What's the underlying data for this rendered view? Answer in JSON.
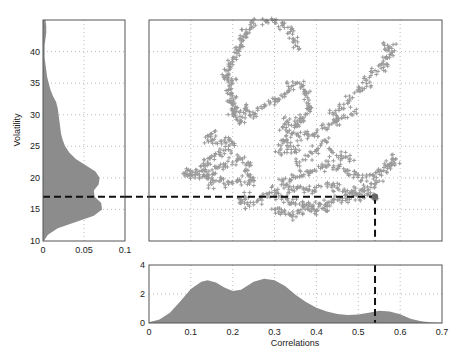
{
  "caption": "",
  "chart_data": [
    {
      "id": "scatter",
      "type": "scatter",
      "title": "",
      "xlabel": "Correlations",
      "ylabel": "Volatility",
      "xlim": [
        0,
        0.7
      ],
      "ylim": [
        10,
        45
      ],
      "xticks": [
        0,
        0.1,
        0.2,
        0.3,
        0.4,
        0.5,
        0.6,
        0.7
      ],
      "yticks": [
        10,
        15,
        20,
        25,
        30,
        35,
        40
      ],
      "grid": true,
      "marker": "+",
      "marker_color": "#9a9a9a",
      "highlight_point": {
        "x": 0.54,
        "y": 17.0,
        "color": "#666666"
      },
      "guide_lines": {
        "style": "dashed",
        "color": "#111111",
        "horizontal_y": 17.0,
        "vertical_x": 0.54
      },
      "series": [
        {
          "name": "trajectory",
          "points": [
            [
              0.28,
              44.8
            ],
            [
              0.3,
              44.6
            ],
            [
              0.32,
              44.2
            ],
            [
              0.34,
              43.5
            ],
            [
              0.345,
              42.0
            ],
            [
              0.35,
              41.0
            ],
            [
              0.25,
              44.5
            ],
            [
              0.24,
              43.5
            ],
            [
              0.23,
              42.8
            ],
            [
              0.225,
              41.8
            ],
            [
              0.22,
              41.0
            ],
            [
              0.215,
              40.0
            ],
            [
              0.2,
              39.0
            ],
            [
              0.19,
              38.0
            ],
            [
              0.19,
              37.0
            ],
            [
              0.185,
              36.2
            ],
            [
              0.19,
              35.5
            ],
            [
              0.2,
              35.0
            ],
            [
              0.19,
              34.0
            ],
            [
              0.2,
              33.0
            ],
            [
              0.195,
              32.0
            ],
            [
              0.2,
              31.5
            ],
            [
              0.21,
              30.5
            ],
            [
              0.2,
              30.0
            ],
            [
              0.21,
              29.5
            ],
            [
              0.23,
              31.0
            ],
            [
              0.24,
              30.5
            ],
            [
              0.22,
              29.0
            ],
            [
              0.25,
              30.0
            ],
            [
              0.27,
              31.0
            ],
            [
              0.29,
              32.0
            ],
            [
              0.31,
              32.5
            ],
            [
              0.33,
              33.5
            ],
            [
              0.34,
              34.5
            ],
            [
              0.36,
              35.0
            ],
            [
              0.37,
              34.0
            ],
            [
              0.375,
              33.0
            ],
            [
              0.38,
              31.5
            ],
            [
              0.385,
              30.5
            ],
            [
              0.37,
              29.5
            ],
            [
              0.36,
              29.0
            ],
            [
              0.35,
              28.5
            ],
            [
              0.33,
              29.0
            ],
            [
              0.32,
              28.0
            ],
            [
              0.34,
              27.0
            ],
            [
              0.36,
              26.5
            ],
            [
              0.38,
              26.8
            ],
            [
              0.4,
              27.2
            ],
            [
              0.42,
              28.0
            ],
            [
              0.44,
              28.8
            ],
            [
              0.45,
              29.0
            ],
            [
              0.44,
              30.0
            ],
            [
              0.46,
              31.0
            ],
            [
              0.48,
              32.5
            ],
            [
              0.5,
              34.0
            ],
            [
              0.52,
              35.5
            ],
            [
              0.54,
              37.0
            ],
            [
              0.56,
              38.5
            ],
            [
              0.575,
              39.5
            ],
            [
              0.58,
              40.5
            ],
            [
              0.57,
              41.0
            ],
            [
              0.56,
              37.5
            ],
            [
              0.52,
              34.5
            ],
            [
              0.49,
              30.5
            ],
            [
              0.46,
              29.5
            ],
            [
              0.33,
              26.0
            ],
            [
              0.32,
              25.5
            ],
            [
              0.34,
              24.5
            ],
            [
              0.31,
              24.0
            ],
            [
              0.15,
              27.0
            ],
            [
              0.14,
              26.0
            ],
            [
              0.16,
              25.5
            ],
            [
              0.18,
              26.0
            ],
            [
              0.2,
              25.5
            ],
            [
              0.19,
              24.5
            ],
            [
              0.17,
              24.0
            ],
            [
              0.15,
              23.5
            ],
            [
              0.14,
              22.5
            ],
            [
              0.13,
              22.0
            ],
            [
              0.12,
              21.0
            ],
            [
              0.1,
              21.0
            ],
            [
              0.09,
              20.5
            ],
            [
              0.11,
              20.0
            ],
            [
              0.13,
              20.5
            ],
            [
              0.15,
              20.0
            ],
            [
              0.16,
              21.5
            ],
            [
              0.18,
              22.0
            ],
            [
              0.2,
              22.5
            ],
            [
              0.22,
              23.0
            ],
            [
              0.24,
              22.0
            ],
            [
              0.23,
              21.0
            ],
            [
              0.25,
              20.0
            ],
            [
              0.24,
              19.0
            ],
            [
              0.21,
              19.5
            ],
            [
              0.19,
              19.0
            ],
            [
              0.17,
              19.5
            ],
            [
              0.15,
              19.0
            ],
            [
              0.14,
              20.5
            ],
            [
              0.23,
              17.0
            ],
            [
              0.22,
              16.0
            ],
            [
              0.24,
              15.5
            ],
            [
              0.26,
              16.5
            ],
            [
              0.28,
              17.5
            ],
            [
              0.3,
              18.0
            ],
            [
              0.31,
              17.0
            ],
            [
              0.33,
              16.5
            ],
            [
              0.35,
              16.0
            ],
            [
              0.37,
              15.8
            ],
            [
              0.39,
              15.5
            ],
            [
              0.41,
              15.8
            ],
            [
              0.43,
              16.2
            ],
            [
              0.45,
              16.5
            ],
            [
              0.47,
              16.8
            ],
            [
              0.49,
              17.2
            ],
            [
              0.51,
              17.0
            ],
            [
              0.53,
              17.2
            ],
            [
              0.54,
              17.0
            ],
            [
              0.3,
              15.0
            ],
            [
              0.32,
              14.5
            ],
            [
              0.34,
              14.0
            ],
            [
              0.36,
              14.5
            ],
            [
              0.38,
              15.0
            ],
            [
              0.4,
              14.8
            ],
            [
              0.42,
              15.2
            ],
            [
              0.33,
              19.0
            ],
            [
              0.35,
              20.0
            ],
            [
              0.37,
              20.5
            ],
            [
              0.39,
              21.0
            ],
            [
              0.41,
              21.5
            ],
            [
              0.43,
              22.0
            ],
            [
              0.45,
              21.5
            ],
            [
              0.47,
              21.0
            ],
            [
              0.49,
              20.5
            ],
            [
              0.51,
              20.0
            ],
            [
              0.53,
              20.5
            ],
            [
              0.55,
              21.0
            ],
            [
              0.57,
              22.0
            ],
            [
              0.58,
              22.5
            ],
            [
              0.59,
              23.0
            ],
            [
              0.57,
              21.5
            ],
            [
              0.55,
              19.5
            ],
            [
              0.53,
              18.5
            ],
            [
              0.51,
              18.2
            ],
            [
              0.49,
              18.0
            ],
            [
              0.47,
              17.8
            ],
            [
              0.45,
              18.5
            ],
            [
              0.43,
              19.0
            ],
            [
              0.4,
              18.5
            ],
            [
              0.38,
              18.0
            ],
            [
              0.36,
              18.5
            ],
            [
              0.34,
              18.2
            ],
            [
              0.32,
              19.5
            ],
            [
              0.36,
              22.5
            ],
            [
              0.38,
              23.5
            ],
            [
              0.4,
              24.5
            ],
            [
              0.42,
              26.0
            ],
            [
              0.44,
              24.0
            ],
            [
              0.46,
              23.5
            ],
            [
              0.48,
              23.0
            ],
            [
              0.35,
              24.5
            ]
          ]
        }
      ]
    },
    {
      "id": "volatility-density",
      "type": "area",
      "title": "",
      "xlabel": "",
      "ylabel": "Volatility",
      "orientation": "horizontal",
      "xlim": [
        0,
        0.1
      ],
      "ylim": [
        10,
        45
      ],
      "xticks": [
        0,
        0.05,
        0.1
      ],
      "yticks": [
        10,
        15,
        20,
        25,
        30,
        35,
        40
      ],
      "grid": true,
      "fill_color": "#8c8c8c",
      "y": [
        10,
        11,
        12,
        13,
        14,
        15,
        16,
        17,
        18,
        19,
        20,
        21,
        22,
        23,
        24,
        25,
        26,
        27,
        28,
        29,
        30,
        31,
        32,
        33,
        34,
        35,
        36,
        37,
        38,
        39,
        40,
        41,
        42,
        43,
        44,
        45
      ],
      "density": [
        0.001,
        0.006,
        0.018,
        0.04,
        0.062,
        0.072,
        0.071,
        0.063,
        0.062,
        0.068,
        0.069,
        0.064,
        0.052,
        0.04,
        0.032,
        0.027,
        0.024,
        0.022,
        0.021,
        0.02,
        0.019,
        0.018,
        0.016,
        0.012,
        0.009,
        0.007,
        0.005,
        0.004,
        0.003,
        0.002,
        0.002,
        0.002,
        0.003,
        0.004,
        0.004,
        0.003
      ],
      "guide_line": {
        "style": "dashed",
        "y": 17.0
      }
    },
    {
      "id": "correlation-density",
      "type": "area",
      "title": "",
      "xlabel": "Correlations",
      "ylabel": "",
      "xlim": [
        0,
        0.7
      ],
      "ylim": [
        0,
        4
      ],
      "xticks": [
        0,
        0.1,
        0.2,
        0.3,
        0.4,
        0.5,
        0.6,
        0.7
      ],
      "yticks": [
        0,
        2,
        4
      ],
      "grid": true,
      "fill_color": "#8c8c8c",
      "x": [
        0,
        0.025,
        0.05,
        0.075,
        0.1,
        0.125,
        0.14,
        0.16,
        0.18,
        0.2,
        0.22,
        0.25,
        0.275,
        0.3,
        0.325,
        0.35,
        0.375,
        0.4,
        0.425,
        0.45,
        0.475,
        0.5,
        0.525,
        0.55,
        0.575,
        0.6,
        0.625,
        0.65,
        0.675,
        0.7
      ],
      "density": [
        0.05,
        0.25,
        0.7,
        1.5,
        2.35,
        2.85,
        2.95,
        2.8,
        2.45,
        2.2,
        2.3,
        2.85,
        3.05,
        2.95,
        2.55,
        1.95,
        1.45,
        1.05,
        0.8,
        0.62,
        0.55,
        0.58,
        0.7,
        0.85,
        0.8,
        0.6,
        0.3,
        0.12,
        0.04,
        0.01
      ],
      "guide_line": {
        "style": "dashed",
        "x": 0.54
      }
    }
  ]
}
